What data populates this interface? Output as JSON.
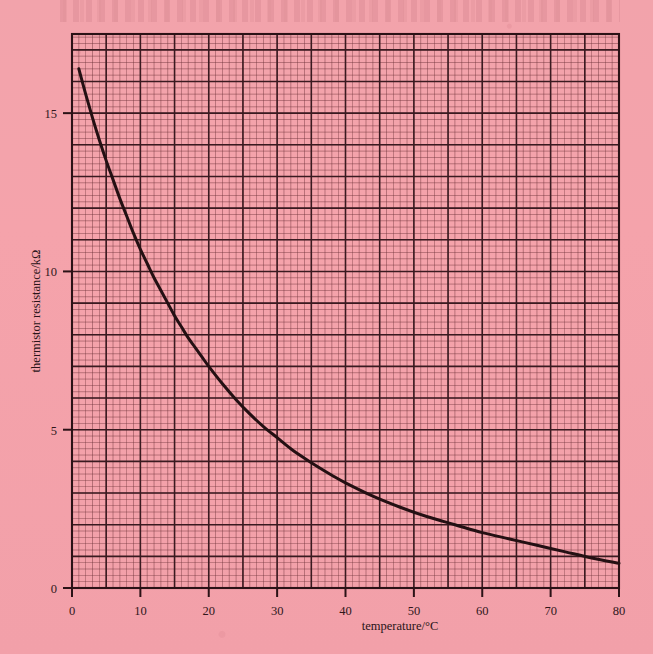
{
  "figure": {
    "background_color": "#f4a0a8",
    "ink_color": "#2b1216",
    "grid_major_color": "#3a1a20",
    "grid_minor_color": "#6b3038",
    "curve_color": "#241013"
  },
  "chart_data": {
    "type": "line",
    "title": "",
    "xlabel": "temperature/°C",
    "ylabel": "thermistor resistance/kΩ",
    "xlim": [
      0,
      80
    ],
    "ylim": [
      0,
      17.5
    ],
    "grid": true,
    "grid_major_x_step": 5,
    "grid_minor_x_step": 1,
    "grid_major_y_step": 1,
    "grid_minor_y_step": 0.2,
    "legend": "none",
    "xticks": [
      0,
      10,
      20,
      30,
      40,
      50,
      60,
      70,
      80
    ],
    "xtick_labels": [
      "0",
      "10",
      "20",
      "30",
      "40",
      "50",
      "60",
      "70",
      "80"
    ],
    "yticks": [
      0,
      5,
      10,
      15
    ],
    "ytick_labels": [
      "0",
      "5",
      "10",
      "15"
    ],
    "series": [
      {
        "name": "thermistor resistance",
        "x": [
          1,
          2,
          3,
          4,
          5,
          6,
          7,
          8,
          9,
          10,
          11,
          12,
          13,
          14,
          15,
          16,
          17,
          18,
          19,
          20,
          22,
          24,
          26,
          28,
          30,
          32,
          34,
          36,
          38,
          40,
          44,
          48,
          52,
          56,
          60,
          64,
          68,
          72,
          76,
          80
        ],
        "y": [
          16.4,
          15.6,
          14.85,
          14.15,
          13.5,
          12.9,
          12.3,
          11.75,
          11.2,
          10.7,
          10.25,
          9.8,
          9.4,
          9.0,
          8.6,
          8.25,
          7.9,
          7.6,
          7.3,
          7.0,
          6.45,
          5.95,
          5.5,
          5.1,
          4.75,
          4.4,
          4.1,
          3.82,
          3.56,
          3.32,
          2.9,
          2.55,
          2.25,
          2.0,
          1.75,
          1.55,
          1.35,
          1.15,
          0.95,
          0.78
        ]
      }
    ]
  }
}
